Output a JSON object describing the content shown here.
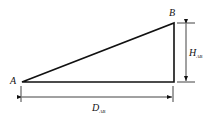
{
  "diagram": {
    "type": "right-triangle-dimension",
    "points": {
      "A": {
        "label": "A"
      },
      "B": {
        "label": "B"
      }
    },
    "dimensions": {
      "height": {
        "label": "H",
        "subscript": "AB"
      },
      "distance": {
        "label": "D",
        "subscript": "AB"
      }
    },
    "colors": {
      "stroke": "#111111",
      "background": "#ffffff"
    }
  }
}
